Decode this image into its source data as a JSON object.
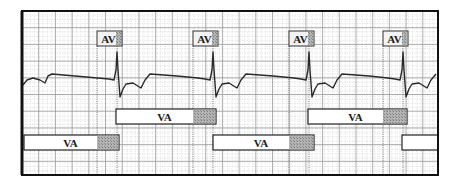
{
  "diagram": {
    "title": "",
    "frame": {
      "x": 22,
      "y": 11,
      "width": 416,
      "height": 164
    },
    "grid": {
      "major_spacing": 16.7,
      "minor_spacing": 4.2,
      "major_color": "#9a9a9a",
      "minor_color": "#c8c8c8"
    },
    "colors": {
      "trace": "#2a2a2a",
      "frame": "#111111",
      "hatch": "#a8a8a8",
      "box_fill": "#ffffff",
      "av_box_fill": "#f2f2f2",
      "dotted": "#555555"
    },
    "av_markers": [
      {
        "label": "AV",
        "box_x": 97,
        "box_y": 31,
        "box_w": 25,
        "box_h": 15,
        "spike_x": 117
      },
      {
        "label": "AV",
        "box_x": 193,
        "box_y": 31,
        "box_w": 25,
        "box_h": 15,
        "spike_x": 213
      },
      {
        "label": "AV",
        "box_x": 289,
        "box_y": 31,
        "box_w": 25,
        "box_h": 15,
        "spike_x": 309
      },
      {
        "label": "AV",
        "box_x": 383,
        "box_y": 31,
        "box_w": 25,
        "box_h": 15,
        "spike_x": 403
      }
    ],
    "va_intervals": [
      {
        "label": "VA",
        "x": 24,
        "y": 135,
        "w": 95,
        "h": 15,
        "hatch_x": 97
      },
      {
        "label": "VA",
        "x": 116,
        "y": 109,
        "w": 100,
        "h": 15,
        "hatch_x": 193
      },
      {
        "label": "VA",
        "x": 213,
        "y": 135,
        "w": 101,
        "h": 15,
        "hatch_x": 289
      },
      {
        "label": "VA",
        "x": 308,
        "y": 109,
        "w": 99,
        "h": 15,
        "hatch_x": 383
      },
      {
        "label": "",
        "x": 402,
        "y": 135,
        "w": 36,
        "h": 15,
        "hatch_x": null
      }
    ]
  }
}
